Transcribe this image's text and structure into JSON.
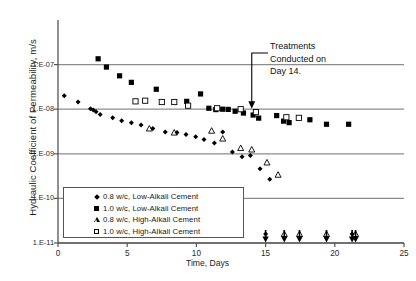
{
  "chart_data": {
    "type": "scatter",
    "title": "",
    "xlabel": "Time, Days",
    "ylabel": "Hydraulic Coefficient of Permeability, m/s",
    "xlim": [
      0,
      25
    ],
    "ylim_log": [
      1e-11,
      1e-06
    ],
    "yscale": "log",
    "xticks": [
      0,
      5,
      10,
      15,
      20,
      25
    ],
    "xtick_labels": [
      "0",
      "5",
      "10",
      "15",
      "20",
      "25"
    ],
    "yticks": [
      1e-07,
      1e-08,
      1e-09,
      1e-10,
      1e-11
    ],
    "ytick_labels": [
      "1.E-07",
      "1.E-08",
      "1.E-09",
      "1.E-10",
      "1.E-11"
    ],
    "grid": "horizontal",
    "legend_position": "lower-left-inside",
    "annotations": [
      {
        "text_lines": [
          "Treatments",
          "Conducted on",
          "Day 14."
        ],
        "arrow_points_to_x": 14,
        "arrow_points_to_y": 1e-08
      }
    ],
    "series": [
      {
        "name": "0.8 w/c, Low-Alkali Cement",
        "marker": "filled-diamond",
        "color": "#000000",
        "points": [
          {
            "x": 0.45,
            "y": 2e-08
          },
          {
            "x": 1.45,
            "y": 1.45e-08
          },
          {
            "x": 2.35,
            "y": 1.02e-08
          },
          {
            "x": 2.55,
            "y": 9.6e-09
          },
          {
            "x": 2.75,
            "y": 8.8e-09
          },
          {
            "x": 3.05,
            "y": 7.6e-09
          },
          {
            "x": 3.95,
            "y": 6.4e-09
          },
          {
            "x": 4.6,
            "y": 5.5e-09
          },
          {
            "x": 5.3,
            "y": 5e-09
          },
          {
            "x": 6.0,
            "y": 4.4e-09
          },
          {
            "x": 6.85,
            "y": 3.7e-09
          },
          {
            "x": 7.75,
            "y": 3.1e-09
          },
          {
            "x": 8.6,
            "y": 3e-09
          },
          {
            "x": 9.25,
            "y": 2.7e-09
          },
          {
            "x": 9.95,
            "y": 2.4e-09
          },
          {
            "x": 10.55,
            "y": 2.1e-09
          },
          {
            "x": 11.3,
            "y": 1.75e-09
          },
          {
            "x": 11.9,
            "y": 3.1e-09
          },
          {
            "x": 12.6,
            "y": 1.1e-09
          },
          {
            "x": 13.3,
            "y": 8.6e-10
          },
          {
            "x": 13.9,
            "y": 9.2e-10
          },
          {
            "x": 14.6,
            "y": 4.6e-10
          },
          {
            "x": 15.3,
            "y": 2.7e-10
          },
          {
            "x": 15.0,
            "y": 1.6e-11
          },
          {
            "x": 21.25,
            "y": 1.6e-11
          }
        ]
      },
      {
        "name": "1.0 w/c, Low-Alkali Cement",
        "marker": "filled-square",
        "color": "#000000",
        "points": [
          {
            "x": 2.9,
            "y": 1.35e-07
          },
          {
            "x": 3.5,
            "y": 8.8e-08
          },
          {
            "x": 4.45,
            "y": 5.6e-08
          },
          {
            "x": 5.3,
            "y": 4e-08
          },
          {
            "x": 7.1,
            "y": 2.8e-08
          },
          {
            "x": 9.3,
            "y": 1.5e-08
          },
          {
            "x": 10.3,
            "y": 2.2e-08
          },
          {
            "x": 10.9,
            "y": 1.05e-08
          },
          {
            "x": 11.4,
            "y": 9.8e-09
          },
          {
            "x": 11.9,
            "y": 1e-08
          },
          {
            "x": 12.3,
            "y": 9.9e-09
          },
          {
            "x": 12.8,
            "y": 9e-09
          },
          {
            "x": 13.4,
            "y": 8.2e-09
          },
          {
            "x": 14.1,
            "y": 7.4e-09
          },
          {
            "x": 14.5,
            "y": 6.3e-09
          },
          {
            "x": 15.8,
            "y": 7.2e-09
          },
          {
            "x": 16.3,
            "y": 5.4e-09
          },
          {
            "x": 16.7,
            "y": 5e-09
          },
          {
            "x": 18.2,
            "y": 5.8e-09
          },
          {
            "x": 19.4,
            "y": 4.6e-09
          },
          {
            "x": 21.0,
            "y": 4.6e-09
          }
        ]
      },
      {
        "name": "0.8 w/c, High-Alkali Cement",
        "marker": "open-triangle",
        "color": "#000000",
        "points": [
          {
            "x": 6.6,
            "y": 3.7e-09
          },
          {
            "x": 8.4,
            "y": 3e-09
          },
          {
            "x": 11.1,
            "y": 3.3e-09
          },
          {
            "x": 11.9,
            "y": 2.2e-09
          },
          {
            "x": 13.2,
            "y": 1.35e-09
          },
          {
            "x": 14.0,
            "y": 1.25e-09
          },
          {
            "x": 15.1,
            "y": 6.4e-10
          },
          {
            "x": 15.9,
            "y": 3.4e-10
          },
          {
            "x": 16.35,
            "y": 1.6e-11
          },
          {
            "x": 17.45,
            "y": 1.6e-11
          },
          {
            "x": 19.4,
            "y": 1.6e-11
          },
          {
            "x": 21.5,
            "y": 1.6e-11
          }
        ]
      },
      {
        "name": "1.0 w/c, High-Alkali Cement",
        "marker": "open-square",
        "color": "#000000",
        "points": [
          {
            "x": 5.6,
            "y": 1.5e-08
          },
          {
            "x": 6.3,
            "y": 1.55e-08
          },
          {
            "x": 7.5,
            "y": 1.45e-08
          },
          {
            "x": 8.4,
            "y": 1.45e-08
          },
          {
            "x": 9.4,
            "y": 1.2e-08
          },
          {
            "x": 11.5,
            "y": 1.05e-08
          },
          {
            "x": 13.2,
            "y": 1e-08
          },
          {
            "x": 14.3,
            "y": 8.6e-09
          },
          {
            "x": 16.5,
            "y": 6.6e-09
          },
          {
            "x": 17.4,
            "y": 6.4e-09
          }
        ]
      }
    ]
  },
  "figure": {
    "y_axis_title": "Hydraulic Coefficient of Permeability, m/s",
    "x_axis_title": "Time, Days",
    "annotation_line1": "Treatments",
    "annotation_line2": "Conducted on",
    "annotation_line3": "Day 14."
  }
}
